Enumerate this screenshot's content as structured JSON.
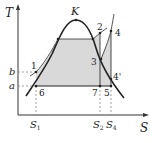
{
  "diagram": {
    "type": "T-S diagram",
    "axes": {
      "y_label": "T",
      "x_label": "S"
    },
    "critical_point": "K",
    "points": [
      "1",
      "2",
      "3",
      "4",
      "4'",
      "5",
      "6",
      "7"
    ],
    "y_levels": {
      "b": "b",
      "a": "a"
    },
    "x_ticks": {
      "s1": "S",
      "s1_sub": "1",
      "s2": "S",
      "s2_sub": "2",
      "s4": "S",
      "s4_sub": "4"
    },
    "colors": {
      "fill": "#d9d9d9",
      "line": "#222222",
      "dashed": "#888888"
    }
  }
}
